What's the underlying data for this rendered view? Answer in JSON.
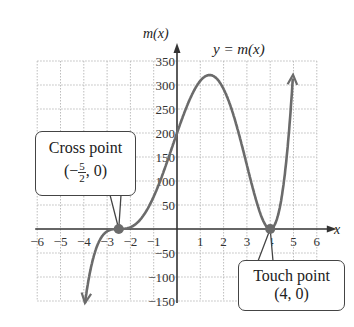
{
  "chart_data": {
    "type": "line",
    "title": "y = m(x)",
    "xlabel": "x",
    "ylabel": "m(x)",
    "xlim": [
      -6,
      6
    ],
    "ylim": [
      -150,
      350
    ],
    "x_ticks": [
      "−6",
      "−5",
      "−4",
      "−3",
      "−2",
      "−1",
      "1",
      "2",
      "3",
      "4",
      "5",
      "6"
    ],
    "y_ticks": [
      "350",
      "300",
      "250",
      "200",
      "150",
      "100",
      "50",
      "−50",
      "−100",
      "−150"
    ],
    "grid": true,
    "function": "m(x) = 0.8 (x + 5/2)^3 (x − 4)^2",
    "series": [
      {
        "name": "y = m(x)",
        "x": [
          -3.95,
          -3.5,
          -3,
          -2.5,
          -2,
          -1,
          0,
          1,
          1.4,
          2,
          3,
          4,
          4.5,
          5
        ],
        "y": [
          -154,
          -39,
          -3,
          0,
          3,
          87,
          200,
          305,
          320,
          281,
          133,
          0,
          22,
          338
        ]
      }
    ],
    "annotations": [
      {
        "label": "Cross point",
        "point": "(−5/2, 0)",
        "x": -2.5,
        "y": 0
      },
      {
        "label": "Touch point",
        "point": "(4, 0)",
        "x": 4,
        "y": 0
      }
    ]
  },
  "labels": {
    "title": "y = m(x)",
    "y_axis": "m(x)",
    "x_axis": "x",
    "cross_title": "Cross point",
    "cross_open": "(−",
    "cross_num": "5",
    "cross_den": "2",
    "cross_close": ", 0)",
    "touch_title": "Touch point",
    "touch_point": "(4, 0)"
  },
  "colors": {
    "curve": "#6b6b6b",
    "point": "#6b6b6b",
    "grid": "#bdbdbd",
    "axis": "#333333"
  }
}
